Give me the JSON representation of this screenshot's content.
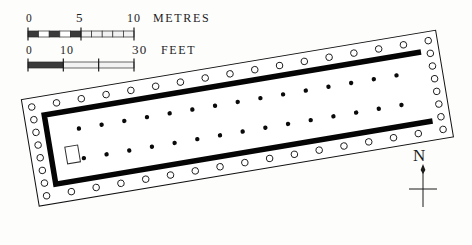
{
  "figure": {
    "kind": "archaeological-site-plan",
    "orientation_deg": -9.5
  },
  "scale_bars": [
    {
      "id": "metres",
      "unit_label": "METRES",
      "ticks": [
        {
          "value": "0",
          "x": 30
        },
        {
          "value": "5",
          "x": 79
        },
        {
          "value": "10",
          "x": 133
        }
      ],
      "bar": {
        "x": 28,
        "y": 31,
        "width": 106,
        "height": 6
      },
      "segments": 10,
      "filled_through": 5
    },
    {
      "id": "feet",
      "unit_label": "FEET",
      "ticks": [
        {
          "value": "0",
          "x": 30
        },
        {
          "value": "10",
          "x": 65
        },
        {
          "value": "30",
          "x": 140
        }
      ],
      "bar": {
        "x": 28,
        "y": 62,
        "width": 106,
        "height": 6
      },
      "segments": 3,
      "filled_through": 1
    }
  ],
  "compass": {
    "label": "N",
    "label_x": 413,
    "label_y": 146,
    "shaft_x": 423,
    "shaft_top": 168,
    "shaft_bottom": 207,
    "crossbar_y": 189,
    "crossbar_half": 14
  },
  "plan": {
    "outer_wall": {
      "name": "stylobate-outline",
      "x": 18,
      "y": 8,
      "width": 420,
      "height": 108,
      "stroke": "#111111",
      "stroke_width": 1,
      "fill": "#ffffff"
    },
    "peristyle": {
      "name": "peristyle-columns",
      "radius": 3.3,
      "stroke": "#151515",
      "fill": "#ffffff",
      "long_count": 17,
      "short_count": 8,
      "inset": 9
    },
    "cella_wall": {
      "name": "cella-wall",
      "x": 38,
      "y": 27,
      "width": 382,
      "height": 70,
      "thickness": 5.5,
      "color": "#050505",
      "open_side": "east"
    },
    "interior_colonnades": [
      {
        "name": "north-inner-colonnade",
        "count": 15,
        "y": 46,
        "x_start": 70,
        "x_end": 392,
        "r": 2.2
      },
      {
        "name": "south-inner-colonnade",
        "count": 15,
        "y": 76,
        "x_start": 70,
        "x_end": 392,
        "r": 2.2
      }
    ],
    "base_block": {
      "name": "cult-statue-base",
      "x": 53,
      "y": 62,
      "width": 13,
      "height": 17,
      "stroke": "#303030",
      "fill": "#ffffff"
    }
  },
  "colors": {
    "ink": "#111111",
    "wall_black": "#050505",
    "paper": "#fdfdfc"
  }
}
